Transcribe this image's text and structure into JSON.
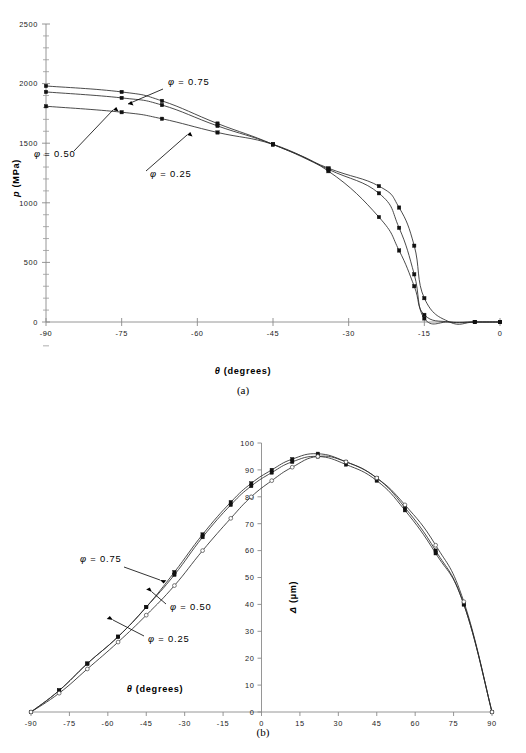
{
  "figure": {
    "background": "#ffffff",
    "panel_a_caption": "(a)",
    "panel_b_caption": "(b)",
    "accent_color": "#2b2b2b",
    "axis_color": "#8a8a8a"
  },
  "chart_data": [
    {
      "type": "line",
      "panel": "(a)",
      "title": "",
      "xlabel": "θ (degrees)",
      "ylabel": "p (MPa)",
      "xlim": [
        -90,
        0
      ],
      "ylim": [
        0,
        2500
      ],
      "xticks": [
        -90,
        -75,
        -60,
        -45,
        -30,
        -15,
        0
      ],
      "xtick_labels": [
        "-90",
        "-75",
        "-60",
        "-45",
        "-30",
        "-15",
        "0"
      ],
      "yticks": [
        0,
        500,
        1000,
        1500,
        2000,
        2500
      ],
      "ytick_labels": [
        "0",
        "500",
        "1000",
        "1500",
        "2000",
        "2500"
      ],
      "minor_tick_divisions": 5,
      "grid": false,
      "legend_position": "inline-annotations",
      "series": [
        {
          "name": "φ = 0.75",
          "marker": "filled-square",
          "x": [
            -90,
            -75,
            -67,
            -56,
            -45,
            -34,
            -24,
            -20,
            -17,
            -15,
            -10,
            -5,
            0
          ],
          "values": [
            1980,
            1930,
            1855,
            1665,
            1490,
            1265,
            880,
            600,
            300,
            60,
            0,
            0,
            0
          ]
        },
        {
          "name": "φ = 0.50",
          "marker": "filled-square",
          "x": [
            -90,
            -75,
            -67,
            -56,
            -45,
            -34,
            -24,
            -20,
            -17,
            -15,
            -10,
            -5,
            0
          ],
          "values": [
            1930,
            1880,
            1820,
            1645,
            1490,
            1280,
            1080,
            790,
            400,
            30,
            0,
            0,
            0
          ]
        },
        {
          "name": "φ = 0.25",
          "marker": "filled-square",
          "x": [
            -90,
            -75,
            -67,
            -56,
            -45,
            -34,
            -24,
            -20,
            -17,
            -15,
            -10,
            -5,
            0
          ],
          "values": [
            1810,
            1760,
            1705,
            1590,
            1490,
            1290,
            1140,
            960,
            640,
            200,
            0,
            0,
            0
          ]
        }
      ],
      "annotations": [
        {
          "text": "φ = 0.75",
          "target_series": "φ = 0.75"
        },
        {
          "text": "φ = 0.50",
          "target_series": "φ = 0.50"
        },
        {
          "text": "φ = 0.25",
          "target_series": "φ = 0.25"
        }
      ]
    },
    {
      "type": "line",
      "panel": "(b)",
      "title": "",
      "xlabel": "θ (degrees)",
      "ylabel": "Δ (µm)",
      "xlim": [
        -90,
        90
      ],
      "ylim": [
        0,
        100
      ],
      "xticks": [
        -90,
        -75,
        -60,
        -45,
        -30,
        -15,
        0,
        15,
        30,
        45,
        60,
        75,
        90
      ],
      "xtick_labels": [
        "-90",
        "-75",
        "-60",
        "-45",
        "-30",
        "-15",
        "0",
        "15",
        "30",
        "45",
        "60",
        "75",
        "90"
      ],
      "yticks": [
        0,
        10,
        20,
        30,
        40,
        50,
        60,
        70,
        80,
        90,
        100
      ],
      "ytick_labels": [
        "0",
        "10",
        "20",
        "30",
        "40",
        "50",
        "60",
        "70",
        "80",
        "90",
        "100"
      ],
      "grid": false,
      "legend_position": "inline-annotations",
      "series": [
        {
          "name": "φ = 0.75",
          "marker": "filled-square",
          "x": [
            -90,
            -79,
            -68,
            -56,
            -45,
            -34,
            -23,
            -12,
            -4,
            4,
            12,
            22,
            33,
            45,
            56,
            68,
            79,
            90
          ],
          "values": [
            0,
            8,
            18,
            28,
            39,
            52,
            66,
            78,
            85,
            90,
            94,
            96,
            93,
            87,
            76,
            60,
            40,
            0
          ]
        },
        {
          "name": "φ = 0.50",
          "marker": "filled-square",
          "x": [
            -90,
            -79,
            -68,
            -56,
            -45,
            -34,
            -23,
            -12,
            -4,
            4,
            12,
            22,
            33,
            45,
            56,
            68,
            79,
            90
          ],
          "values": [
            0,
            8,
            18,
            28,
            39,
            51,
            65,
            77,
            84,
            89,
            93,
            95,
            92,
            86,
            75,
            59,
            40,
            0
          ]
        },
        {
          "name": "φ = 0.25",
          "marker": "open-circle",
          "x": [
            -90,
            -79,
            -68,
            -56,
            -45,
            -34,
            -23,
            -12,
            -4,
            4,
            12,
            22,
            33,
            45,
            56,
            68,
            79,
            90
          ],
          "values": [
            0,
            7,
            16,
            26,
            36,
            47,
            60,
            72,
            80,
            86,
            91,
            95,
            93,
            87,
            77,
            62,
            41,
            0
          ]
        }
      ],
      "annotations": [
        {
          "text": "φ = 0.75",
          "target_series": "φ = 0.75"
        },
        {
          "text": "φ = 0.50",
          "target_series": "φ = 0.50"
        },
        {
          "text": "φ = 0.25",
          "target_series": "φ = 0.25"
        }
      ]
    }
  ]
}
